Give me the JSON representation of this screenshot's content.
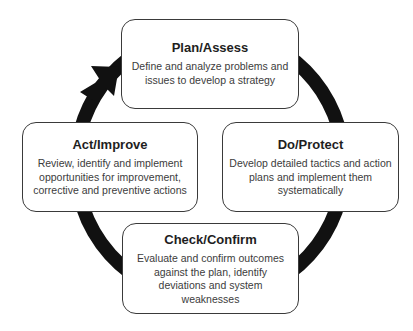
{
  "diagram": {
    "type": "cycle",
    "colors": {
      "ring": "#111111",
      "box_border": "#3a3a3a",
      "box_fill": "#ffffff",
      "text": "#333333"
    },
    "arrow_icon": "cycle-arrow",
    "steps": [
      {
        "id": "plan",
        "title": "Plan/Assess",
        "description": "Define and analyze problems and issues to develop a strategy"
      },
      {
        "id": "do",
        "title": "Do/Protect",
        "description": "Develop detailed tactics and action plans and implement them systematically"
      },
      {
        "id": "check",
        "title": "Check/Confirm",
        "description": "Evaluate and confirm outcomes against the plan, identify deviations and system weaknesses"
      },
      {
        "id": "act",
        "title": "Act/Improve",
        "description": "Review, identify and implement opportunities for improvement, corrective and preventive actions"
      }
    ]
  }
}
